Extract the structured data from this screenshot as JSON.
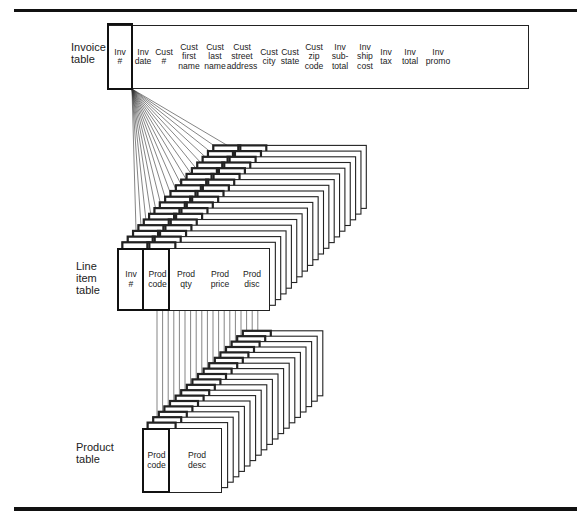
{
  "diagram": {
    "type": "database-schema-relationship",
    "tables": [
      {
        "id": "invoice",
        "label": "Invoice\ntable",
        "columns": [
          {
            "label": "Inv\n#",
            "key": true
          },
          {
            "label": "Inv\ndate"
          },
          {
            "label": "Cust\n#"
          },
          {
            "label": "Cust\nfirst\nname"
          },
          {
            "label": "Cust\nlast\nname"
          },
          {
            "label": "Cust\nstreet\naddress"
          },
          {
            "label": "Cust\ncity"
          },
          {
            "label": "Cust\nstate"
          },
          {
            "label": "Cust\nzip\ncode"
          },
          {
            "label": "Inv\nsub-\ntotal"
          },
          {
            "label": "Inv\nship\ncost"
          },
          {
            "label": "Inv\ntax"
          },
          {
            "label": "Inv\ntotal"
          },
          {
            "label": "Inv\npromo"
          }
        ]
      },
      {
        "id": "line_item",
        "label": "Line\nitem\ntable",
        "columns": [
          {
            "label": "Inv\n#",
            "key": true
          },
          {
            "label": "Prod\ncode",
            "key": true
          },
          {
            "label": "Prod\nqty"
          },
          {
            "label": "Prod\nprice"
          },
          {
            "label": "Prod\ndisc"
          }
        ],
        "stack_depth": 19
      },
      {
        "id": "product",
        "label": "Product\ntable",
        "columns": [
          {
            "label": "Prod\ncode",
            "key": true
          },
          {
            "label": "Prod\ndesc"
          }
        ],
        "stack_depth": 19
      }
    ],
    "relationships": [
      {
        "from": "invoice.Inv #",
        "to": "line_item.Inv #",
        "cardinality": "one-to-many"
      },
      {
        "from": "line_item.Prod code",
        "to": "product.Prod code",
        "cardinality": "many-to-one"
      }
    ],
    "colors": {
      "line": "#222222",
      "background": "#ffffff"
    }
  }
}
